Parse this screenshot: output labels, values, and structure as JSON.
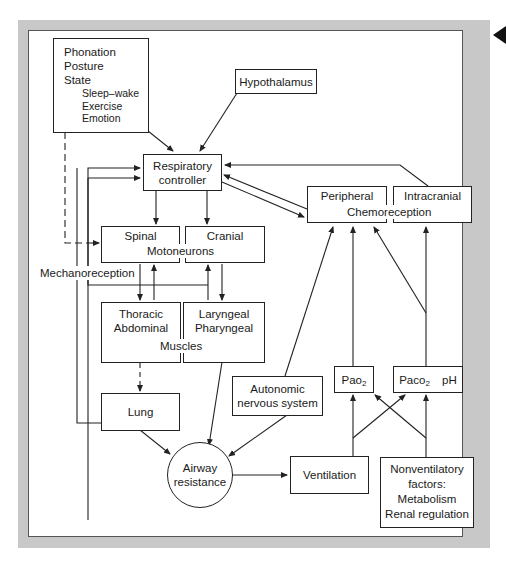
{
  "diagram": {
    "title": "",
    "nodes": {
      "influences": {
        "lines": [
          "Phonation",
          "Posture",
          "State"
        ],
        "state_sub": [
          "Sleep–wake",
          "Exercise",
          "Emotion"
        ]
      },
      "hypothalamus": "Hypothalamus",
      "respiratory_controller": [
        "Respiratory",
        "controller"
      ],
      "motoneurons": {
        "spinal": "Spinal",
        "cranial": "Cranial",
        "group_label": "Motoneurons"
      },
      "mechanoreception": "Mechanoreception",
      "muscles": {
        "thoracic": [
          "Thoracic",
          "Abdominal"
        ],
        "laryngeal": [
          "Laryngeal",
          "Pharyngeal"
        ],
        "group_label": "Muscles"
      },
      "lung": "Lung",
      "airway_resistance": [
        "Airway",
        "resistance"
      ],
      "autonomic": [
        "Autonomic",
        "nervous system"
      ],
      "ventilation": "Ventilation",
      "chemoreception": {
        "peripheral": "Peripheral",
        "intracranial": "Intracranial",
        "group_label": "Chemoreception"
      },
      "pao2": {
        "base": "Pao",
        "sub": "2"
      },
      "paco2": {
        "base": "Paco",
        "sub": "2",
        "extra": "pH"
      },
      "nonventilatory": [
        "Nonventilatory",
        "factors:",
        "Metabolism",
        "Renal regulation"
      ]
    },
    "edges": [
      [
        "influences",
        "respiratory_controller"
      ],
      [
        "influences",
        "spinal_motoneurons",
        "dashed"
      ],
      [
        "hypothalamus",
        "respiratory_controller"
      ],
      [
        "respiratory_controller",
        "spinal_motoneurons"
      ],
      [
        "respiratory_controller",
        "cranial_motoneurons"
      ],
      [
        "respiratory_controller",
        "peripheral_chemoreception"
      ],
      [
        "peripheral_chemoreception",
        "respiratory_controller"
      ],
      [
        "intracranial_chemoreception",
        "respiratory_controller"
      ],
      [
        "spinal_motoneurons",
        "thoracic_muscles"
      ],
      [
        "thoracic_muscles",
        "spinal_motoneurons"
      ],
      [
        "cranial_motoneurons",
        "laryngeal_muscles"
      ],
      [
        "laryngeal_muscles",
        "cranial_motoneurons"
      ],
      [
        "mechanoreception",
        "respiratory_controller"
      ],
      [
        "lung",
        "respiratory_controller"
      ],
      [
        "thoracic_muscles",
        "lung",
        "dashed"
      ],
      [
        "lung",
        "airway_resistance"
      ],
      [
        "laryngeal_muscles",
        "airway_resistance"
      ],
      [
        "autonomic",
        "airway_resistance"
      ],
      [
        "airway_resistance",
        "autonomic"
      ],
      [
        "autonomic",
        "peripheral_chemoreception"
      ],
      [
        "airway_resistance",
        "ventilation"
      ],
      [
        "ventilation",
        "pao2"
      ],
      [
        "ventilation",
        "paco2"
      ],
      [
        "nonventilatory",
        "pao2"
      ],
      [
        "nonventilatory",
        "paco2"
      ],
      [
        "pao2",
        "peripheral_chemoreception"
      ],
      [
        "paco2",
        "peripheral_chemoreception"
      ],
      [
        "paco2",
        "intracranial_chemoreception"
      ]
    ],
    "colors": {
      "frame": "#c8c8c8",
      "line": "#222222",
      "background": "#ffffff"
    }
  }
}
